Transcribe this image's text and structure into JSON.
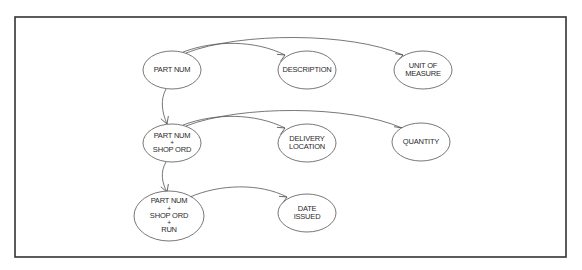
{
  "diagram": {
    "type": "functional-dependency-diagram",
    "frame": {
      "x": 15,
      "y": 17,
      "width": 551,
      "height": 240,
      "stroke": "#333333"
    },
    "colors": {
      "line": "#555555",
      "text": "#2a2a2a",
      "background": "#ffffff"
    },
    "nodes": [
      {
        "id": "part_num",
        "lines": [
          "PART NUM"
        ],
        "cx": 172,
        "cy": 70,
        "rx": 29,
        "ry": 19
      },
      {
        "id": "description",
        "lines": [
          "DESCRIPTION"
        ],
        "cx": 307,
        "cy": 70,
        "rx": 29,
        "ry": 19
      },
      {
        "id": "unit_of_measure",
        "lines": [
          "UNIT OF",
          "MEASURE"
        ],
        "cx": 423,
        "cy": 70,
        "rx": 29,
        "ry": 19
      },
      {
        "id": "part_num_shop_ord",
        "lines": [
          "PART NUM",
          "+",
          "SHOP ORD"
        ],
        "cx": 172,
        "cy": 143,
        "rx": 29,
        "ry": 19
      },
      {
        "id": "delivery_location",
        "lines": [
          "DELIVERY",
          "LOCATION"
        ],
        "cx": 307,
        "cy": 143,
        "rx": 29,
        "ry": 19
      },
      {
        "id": "quantity",
        "lines": [
          "QUANTITY"
        ],
        "cx": 421,
        "cy": 142,
        "rx": 29,
        "ry": 19
      },
      {
        "id": "part_num_shop_ord_run",
        "lines": [
          "PART NUM",
          "+",
          "SHOP ORD",
          "+",
          "RUN"
        ],
        "cx": 169,
        "cy": 216,
        "rx": 35,
        "ry": 25
      },
      {
        "id": "date_issued",
        "lines": [
          "DATE",
          "ISSUED"
        ],
        "cx": 307,
        "cy": 213,
        "rx": 29,
        "ry": 19
      }
    ],
    "edges": [
      {
        "from": "part_num",
        "to": "description",
        "path": "M183,52 C215,40 255,40 285,55",
        "head": [
          285,
          55,
          -25
        ]
      },
      {
        "from": "part_num",
        "to": "unit_of_measure",
        "path": "M186,53 C240,32 350,32 403,55",
        "head": [
          403,
          55,
          -20
        ]
      },
      {
        "from": "part_num",
        "to": "part_num_shop_ord",
        "path": "M166,89 C160,100 162,112 167,124",
        "head": [
          167,
          124,
          70
        ]
      },
      {
        "from": "part_num_shop_ord",
        "to": "delivery_location",
        "path": "M183,125 C215,113 255,113 285,128",
        "head": [
          285,
          128,
          -25
        ]
      },
      {
        "from": "part_num_shop_ord",
        "to": "quantity",
        "path": "M186,126 C240,105 350,105 402,128",
        "head": [
          402,
          128,
          -20
        ]
      },
      {
        "from": "part_num_shop_ord",
        "to": "part_num_shop_ord_run",
        "path": "M166,162 C160,172 162,183 167,192",
        "head": [
          167,
          192,
          70
        ]
      },
      {
        "from": "part_num_shop_ord_run",
        "to": "date_issued",
        "path": "M190,197 C220,184 260,183 287,197",
        "head": [
          287,
          197,
          -25
        ]
      }
    ]
  }
}
